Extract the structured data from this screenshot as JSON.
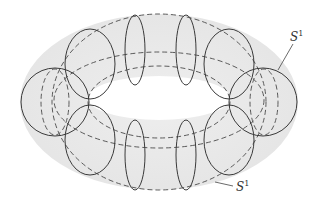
{
  "diagram": {
    "labels": [
      {
        "id": "meridian",
        "text": "S",
        "sup": "1"
      },
      {
        "id": "longitude",
        "text": "S",
        "sup": "1"
      }
    ],
    "colors": {
      "fill": "#e9e9e9",
      "stroke": "#3a3a3a",
      "dash": "#4a4a4a"
    }
  }
}
